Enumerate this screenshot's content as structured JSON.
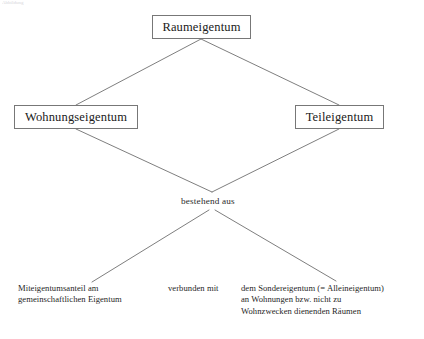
{
  "diagram": {
    "type": "hierarchy",
    "title_artifact": "Abbildung",
    "nodes": {
      "root": {
        "label": "Raumeigentum"
      },
      "left": {
        "label": "Wohnungseigentum"
      },
      "right": {
        "label": "Teileigentum"
      }
    },
    "middle_label": {
      "text": "bestehend aus"
    },
    "leaves": {
      "left": {
        "lines": [
          "Miteigentumsanteil am",
          "gemeinschaftlichen Eigentum"
        ]
      },
      "center": {
        "lines": [
          "verbunden mit"
        ]
      },
      "right": {
        "lines": [
          "dem Sondereigentum (= Alleineigentum)",
          "an Wohnungen bzw. nicht zu",
          "Wohnzwecken dienenden Räumen"
        ]
      }
    },
    "colors": {
      "background": "#ffffff",
      "box_border": "#777777",
      "connector": "#6f6f6f",
      "text": "#1f1f1f"
    },
    "connectors": [
      {
        "name": "root-to-left",
        "from": [
          201,
          39
        ],
        "to": [
          76,
          105
        ]
      },
      {
        "name": "root-to-right",
        "from": [
          201,
          39
        ],
        "to": [
          339,
          105
        ]
      },
      {
        "name": "left-to-hub",
        "from": [
          76,
          129
        ],
        "to": [
          212,
          192
        ]
      },
      {
        "name": "right-to-hub",
        "from": [
          339,
          129
        ],
        "to": [
          212,
          192
        ]
      },
      {
        "name": "hub-to-leaf-left",
        "from": [
          209,
          210
        ],
        "to": [
          92,
          282
        ]
      },
      {
        "name": "hub-to-leaf-right",
        "from": [
          215,
          210
        ],
        "to": [
          336,
          281
        ]
      }
    ]
  }
}
